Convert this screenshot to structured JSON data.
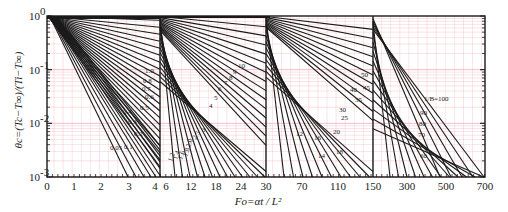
{
  "chart_data": {
    "type": "line",
    "title": "",
    "xlabel": "Fo=αt / L²",
    "ylabel": "θc=(Tc−T∞)/(Ti−T∞)",
    "y_scale": "log",
    "ylim": [
      0.001,
      1
    ],
    "y_tick_labels": [
      "10⁰",
      "10⁻¹",
      "10⁻²",
      "10⁻³"
    ],
    "grid": true,
    "grid_color": "#f4b6c2",
    "line_color": "#1a1a1a",
    "x_panels": [
      {
        "range": [
          0,
          4
        ],
        "tick_labels": [
          "0",
          "1",
          "2",
          "3",
          "4"
        ],
        "curve_labels": [
          "0.05",
          "0.1",
          "0.2",
          "0.3",
          "0.4",
          "0.5",
          "0.6",
          "0.7",
          "0.8",
          "1.0"
        ]
      },
      {
        "range": [
          6,
          30
        ],
        "tick_labels": [
          "6",
          "12",
          "18",
          "24",
          "30"
        ],
        "curve_labels": [
          "1.2",
          "1.4",
          "1.6",
          "1.8",
          "2.0",
          "2.5",
          "3",
          "4",
          "5",
          "6",
          "7",
          "8",
          "9",
          "10"
        ]
      },
      {
        "range": [
          30,
          150
        ],
        "tick_labels": [
          "70",
          "110",
          "150"
        ],
        "curve_labels": [
          "12",
          "14",
          "16",
          "18",
          "20",
          "25",
          "30",
          "35",
          "40",
          "45",
          "50"
        ]
      },
      {
        "range": [
          150,
          700
        ],
        "tick_labels": [
          "300",
          "500",
          "700"
        ],
        "curve_labels": [
          "60",
          "70",
          "80",
          "90",
          "1/B=100"
        ]
      }
    ],
    "series_parameter": "1/Bi",
    "series": [
      {
        "name": "0.05",
        "fo_at_0.001": 3.4
      },
      {
        "name": "0.1",
        "fo_at_0.001": 3.7
      },
      {
        "name": "0.2",
        "fo_at_0.001": 3.95
      },
      {
        "name": "1.0",
        "fo_at_0.001": 5.2
      },
      {
        "name": "10",
        "fo_at_0.001": 32
      },
      {
        "name": "50",
        "fo_at_0.001": 140
      },
      {
        "name": "100",
        "fo_at_0.001": 700
      }
    ]
  },
  "axes": {
    "y_title": "θc=(Tc−T∞)/(Ti−T∞)",
    "x_title": "Fo=αt / L²",
    "x_ticks": [
      {
        "label": "0",
        "x": 47
      },
      {
        "label": "1",
        "x": 74
      },
      {
        "label": "2",
        "x": 101
      },
      {
        "label": "3",
        "x": 129
      },
      {
        "label": "4",
        "x": 155
      },
      {
        "label": "6",
        "x": 166
      },
      {
        "label": "12",
        "x": 191
      },
      {
        "label": "18",
        "x": 216
      },
      {
        "label": "24",
        "x": 241
      },
      {
        "label": "30",
        "x": 266
      },
      {
        "label": "70",
        "x": 302
      },
      {
        "label": "110",
        "x": 338
      },
      {
        "label": "150",
        "x": 373
      },
      {
        "label": "300",
        "x": 407
      },
      {
        "label": "500",
        "x": 446
      },
      {
        "label": "700",
        "x": 485
      }
    ],
    "y_ticks": [
      {
        "label": "10",
        "exp": "0",
        "y": 16
      },
      {
        "label": "10",
        "exp": "-1",
        "y": 70
      },
      {
        "label": "10",
        "exp": "-2",
        "y": 123
      },
      {
        "label": "10",
        "exp": "-3",
        "y": 177
      }
    ]
  }
}
